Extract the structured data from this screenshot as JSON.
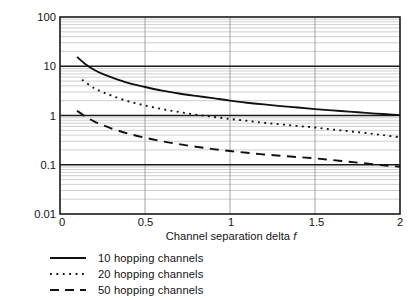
{
  "chart_data": {
    "type": "line",
    "title": "",
    "xlabel": "Channel separation delta f",
    "ylabel": "Standard deviation of distance, meters",
    "xlim": [
      0,
      2
    ],
    "ylim": [
      0.01,
      100
    ],
    "yscale": "log",
    "xscale": "linear",
    "grid": true,
    "grid_detail": "horizontal log minor gridlines plus vertical lines at 0.5, 1, 1.5",
    "xticks": [
      "0",
      "0.5",
      "1",
      "1.5",
      "2"
    ],
    "xtick_values": [
      0,
      0.5,
      1,
      1.5,
      2
    ],
    "yticks": [
      "0.01",
      "0.1",
      "1",
      "10",
      "100"
    ],
    "ytick_values": [
      0.01,
      0.1,
      1,
      10,
      100
    ],
    "legend_position": "below-left",
    "series": [
      {
        "name": "10 hopping channels",
        "style": "solid",
        "color": "#111111",
        "x": [
          0.1,
          0.15,
          0.2,
          0.25,
          0.3,
          0.4,
          0.5,
          0.6,
          0.7,
          0.8,
          0.9,
          1.0,
          1.1,
          1.2,
          1.3,
          1.4,
          1.5,
          1.6,
          1.7,
          1.8,
          1.9,
          2.0
        ],
        "y": [
          15.5,
          11.0,
          8.5,
          7.0,
          6.0,
          4.6,
          3.8,
          3.2,
          2.8,
          2.5,
          2.25,
          2.0,
          1.82,
          1.68,
          1.55,
          1.45,
          1.35,
          1.27,
          1.2,
          1.13,
          1.07,
          1.02
        ]
      },
      {
        "name": "20 hopping channels",
        "style": "dotted",
        "color": "#111111",
        "x": [
          0.13,
          0.2,
          0.25,
          0.3,
          0.4,
          0.5,
          0.6,
          0.7,
          0.8,
          0.9,
          1.0,
          1.1,
          1.2,
          1.3,
          1.4,
          1.5,
          1.6,
          1.7,
          1.8,
          1.9,
          2.0
        ],
        "y": [
          5.3,
          3.6,
          3.0,
          2.55,
          1.95,
          1.6,
          1.35,
          1.18,
          1.04,
          0.94,
          0.85,
          0.78,
          0.71,
          0.66,
          0.61,
          0.57,
          0.52,
          0.48,
          0.44,
          0.4,
          0.36
        ]
      },
      {
        "name": "50 hopping channels",
        "style": "dashed",
        "color": "#111111",
        "x": [
          0.1,
          0.15,
          0.2,
          0.25,
          0.3,
          0.4,
          0.5,
          0.6,
          0.7,
          0.8,
          0.9,
          1.0,
          1.1,
          1.2,
          1.3,
          1.4,
          1.5,
          1.6,
          1.7,
          1.8,
          1.9,
          2.0
        ],
        "y": [
          1.25,
          0.95,
          0.76,
          0.64,
          0.55,
          0.43,
          0.355,
          0.3,
          0.262,
          0.232,
          0.208,
          0.19,
          0.175,
          0.162,
          0.152,
          0.143,
          0.135,
          0.125,
          0.115,
          0.106,
          0.098,
          0.091
        ]
      }
    ]
  },
  "axis": {
    "ylabel": "Standard deviation of distance, meters",
    "xlabel_prefix": "Channel separation delta ",
    "xlabel_italic": "f"
  },
  "legend": {
    "items": [
      {
        "label": "10 hopping channels",
        "style": "solid"
      },
      {
        "label": "20 hopping channels",
        "style": "dotted"
      },
      {
        "label": "50 hopping channels",
        "style": "dashed"
      }
    ]
  },
  "colors": {
    "ink": "#111111",
    "grid_minor": "#c9c9c9",
    "grid_major": "#7a7a7a",
    "frame": "#1a1a1a",
    "background": "#ffffff"
  }
}
